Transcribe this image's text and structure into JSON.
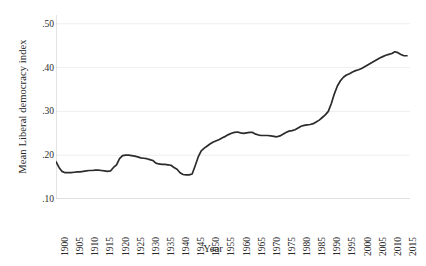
{
  "chart_data": {
    "type": "line",
    "title": "",
    "xlabel": "Year",
    "ylabel": "Mean Liberal democracy index",
    "xlim": [
      1900,
      2017
    ],
    "ylim": [
      0.1,
      0.52
    ],
    "grid": true,
    "legend": false,
    "line_color": "#2b2b2b",
    "grid_color": "#eeeeee",
    "axis_color": "#c8c8c8",
    "ytick_labels": [
      ".50",
      ".40",
      ".30",
      ".20",
      ".10"
    ],
    "ytick_values": [
      0.5,
      0.4,
      0.3,
      0.2,
      0.1
    ],
    "xtick_labels": [
      "1900",
      "1905",
      "1910",
      "1915",
      "1920",
      "1925",
      "1930",
      "1935",
      "1940",
      "1945",
      "1950",
      "1955",
      "1960",
      "1965",
      "1970",
      "1975",
      "1980",
      "1985",
      "1990",
      "1995",
      "2000",
      "2005",
      "2010",
      "2015"
    ],
    "xtick_values": [
      1900,
      1905,
      1910,
      1915,
      1920,
      1925,
      1930,
      1935,
      1940,
      1945,
      1950,
      1955,
      1960,
      1965,
      1970,
      1975,
      1980,
      1985,
      1990,
      1995,
      2000,
      2005,
      2010,
      2015
    ],
    "series": [
      {
        "name": "Mean Liberal democracy index",
        "x": [
          1900,
          1901,
          1902,
          1903,
          1904,
          1905,
          1906,
          1907,
          1908,
          1909,
          1910,
          1911,
          1912,
          1913,
          1914,
          1915,
          1916,
          1917,
          1918,
          1919,
          1920,
          1921,
          1922,
          1923,
          1924,
          1925,
          1926,
          1927,
          1928,
          1929,
          1930,
          1931,
          1932,
          1933,
          1934,
          1935,
          1936,
          1937,
          1938,
          1939,
          1940,
          1941,
          1942,
          1943,
          1944,
          1945,
          1946,
          1947,
          1948,
          1949,
          1950,
          1951,
          1952,
          1953,
          1954,
          1955,
          1956,
          1957,
          1958,
          1959,
          1960,
          1961,
          1962,
          1963,
          1964,
          1965,
          1966,
          1967,
          1968,
          1969,
          1970,
          1971,
          1972,
          1973,
          1974,
          1975,
          1976,
          1977,
          1978,
          1979,
          1980,
          1981,
          1982,
          1983,
          1984,
          1985,
          1986,
          1987,
          1988,
          1989,
          1990,
          1991,
          1992,
          1993,
          1994,
          1995,
          1996,
          1997,
          1998,
          1999,
          2000,
          2001,
          2002,
          2003,
          2004,
          2005,
          2006,
          2007,
          2008,
          2009,
          2010,
          2011,
          2012,
          2013,
          2014,
          2015,
          2016
        ],
        "y": [
          0.185,
          0.172,
          0.163,
          0.16,
          0.16,
          0.16,
          0.161,
          0.162,
          0.162,
          0.163,
          0.164,
          0.165,
          0.165,
          0.166,
          0.166,
          0.165,
          0.164,
          0.163,
          0.164,
          0.172,
          0.178,
          0.192,
          0.199,
          0.2,
          0.2,
          0.199,
          0.198,
          0.196,
          0.194,
          0.193,
          0.192,
          0.19,
          0.188,
          0.182,
          0.18,
          0.179,
          0.179,
          0.178,
          0.177,
          0.172,
          0.168,
          0.16,
          0.156,
          0.155,
          0.155,
          0.157,
          0.176,
          0.196,
          0.21,
          0.216,
          0.221,
          0.226,
          0.23,
          0.233,
          0.236,
          0.24,
          0.243,
          0.247,
          0.25,
          0.252,
          0.253,
          0.251,
          0.25,
          0.251,
          0.252,
          0.252,
          0.248,
          0.246,
          0.245,
          0.245,
          0.245,
          0.244,
          0.243,
          0.242,
          0.244,
          0.248,
          0.252,
          0.255,
          0.256,
          0.258,
          0.262,
          0.266,
          0.268,
          0.269,
          0.27,
          0.272,
          0.276,
          0.28,
          0.286,
          0.292,
          0.3,
          0.318,
          0.34,
          0.358,
          0.37,
          0.378,
          0.383,
          0.386,
          0.39,
          0.393,
          0.395,
          0.398,
          0.402,
          0.406,
          0.41,
          0.414,
          0.418,
          0.422,
          0.425,
          0.428,
          0.43,
          0.432,
          0.436,
          0.434,
          0.43,
          0.427,
          0.427
        ]
      }
    ]
  }
}
